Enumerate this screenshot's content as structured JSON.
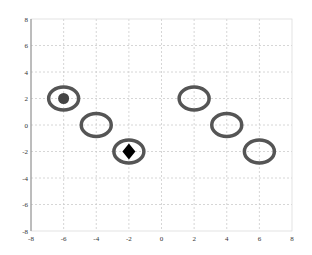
{
  "chart_data": {
    "type": "scatter",
    "title": "",
    "xlabel": "",
    "ylabel": "",
    "xlim": [
      -8,
      8
    ],
    "ylim": [
      -8,
      8
    ],
    "grid": true,
    "xticks": [
      -8,
      -6,
      -4,
      -2,
      0,
      2,
      4,
      6,
      8
    ],
    "yticks": [
      -8,
      -6,
      -4,
      -2,
      0,
      2,
      4,
      6,
      8
    ],
    "xtick_labels": [
      "-8",
      "-6",
      "-4",
      "-2",
      "0",
      "2",
      "4",
      "6",
      "8"
    ],
    "ytick_labels": [
      "-8",
      "-6",
      "-4",
      "-2",
      "0",
      "2",
      "4",
      "6",
      "8"
    ],
    "series": [
      {
        "name": "circles",
        "marker": "ellipse-ring",
        "points": [
          {
            "x": -6,
            "y": 2
          },
          {
            "x": -4,
            "y": 0
          },
          {
            "x": -2,
            "y": -2
          },
          {
            "x": 2,
            "y": 2
          },
          {
            "x": 4,
            "y": 0
          },
          {
            "x": 6,
            "y": -2
          }
        ]
      },
      {
        "name": "start",
        "marker": "filled-circle",
        "points": [
          {
            "x": -6,
            "y": 2
          }
        ]
      },
      {
        "name": "goal",
        "marker": "filled-diamond",
        "points": [
          {
            "x": -2,
            "y": -2
          }
        ]
      }
    ]
  },
  "colors": {
    "ring": "#555555",
    "dot": "#444444",
    "diamond": "#000000",
    "grid": "#cccccc",
    "axis": "#888888"
  }
}
